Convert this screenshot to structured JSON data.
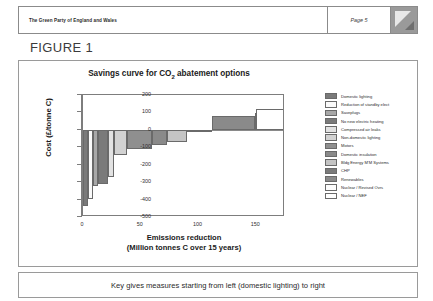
{
  "header": {
    "org_title": "The Green Party of England and Wales",
    "page_label": "Page 5",
    "logo_icon": "triangle-logo-icon"
  },
  "figure": {
    "label": "FIGURE 1"
  },
  "caption": {
    "text": "Key gives measures starting from left (domestic lighting) to right"
  },
  "chart_data": {
    "type": "bar",
    "title": "Savings curve for CO2 abatement options",
    "title_prefix": "Savings curve for CO",
    "title_sub": "2",
    "title_suffix": " abatement options",
    "xlabel_line1": "Emissions reduction",
    "xlabel_line2": "(Million tonnes C over 15 years)",
    "ylabel": "Cost (£/tonne C)",
    "xlim": [
      0,
      175
    ],
    "ylim": [
      -500,
      200
    ],
    "xticks": [
      0,
      50,
      100,
      150
    ],
    "yticks": [
      200,
      100,
      0,
      -100,
      -200,
      -300,
      -400,
      -500
    ],
    "grid": false,
    "legend_position": "right",
    "orientation": "marginal-abatement-cost-curve",
    "bars": [
      {
        "label": "Domestic lighting",
        "width": 4,
        "cost": -435,
        "color": "#7a7a7a"
      },
      {
        "label": "Reduction of standby elect",
        "width": 5,
        "cost": -395,
        "color": "#fafafa"
      },
      {
        "label": "Saveplugs",
        "width": 4,
        "cost": -320,
        "color": "#a8a8a8"
      },
      {
        "label": "No new electric heating",
        "width": 9,
        "cost": -308,
        "color": "#7a7a7a"
      },
      {
        "label": "Compressed air leaks",
        "width": 5,
        "cost": -268,
        "color": "#e2e2e2"
      },
      {
        "label": "Non-domestic lighting",
        "width": 11,
        "cost": -143,
        "color": "#d2d2d2"
      },
      {
        "label": "Motors",
        "width": 22,
        "cost": -112,
        "color": "#8f8f8f"
      },
      {
        "label": "Domestic insulation",
        "width": 13,
        "cost": -88,
        "color": "#8a8a8a"
      },
      {
        "label": "Bldg Energy M'M Systems",
        "width": 17,
        "cost": -70,
        "color": "#c4c4c4"
      },
      {
        "label": "CHP",
        "width": 22,
        "cost": -5,
        "color": "#7a7a7a"
      },
      {
        "label": "Renewables",
        "width": 37,
        "cost": 78,
        "color": "#8a8a8a"
      },
      {
        "label": "Nuclear / Revised Ovrs",
        "width": 1,
        "cost": 95,
        "color": "#fdfdfd"
      },
      {
        "label": "Nuclear / NEF",
        "width": 25,
        "cost": 118,
        "color": "#ffffff"
      }
    ]
  }
}
